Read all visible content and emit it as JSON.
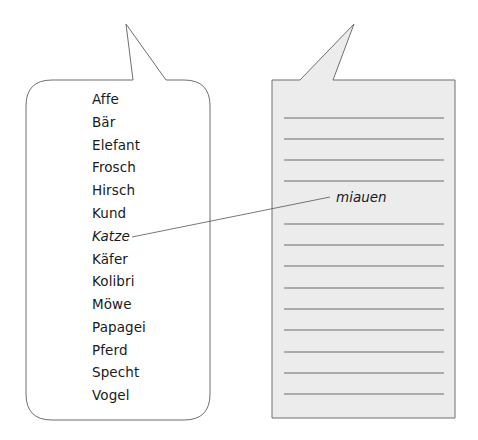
{
  "exercise": {
    "left_bubble": {
      "words": [
        {
          "text": "Affe",
          "italic": false
        },
        {
          "text": "Bär",
          "italic": false
        },
        {
          "text": "Elefant",
          "italic": false
        },
        {
          "text": "Frosch",
          "italic": false
        },
        {
          "text": "Hirsch",
          "italic": false
        },
        {
          "text": "Kund",
          "italic": false
        },
        {
          "text": "Katze",
          "italic": true
        },
        {
          "text": "Käfer",
          "italic": false
        },
        {
          "text": "Kolibri",
          "italic": false
        },
        {
          "text": "Möwe",
          "italic": false
        },
        {
          "text": "Papagei",
          "italic": false
        },
        {
          "text": "Pferd",
          "italic": false
        },
        {
          "text": "Specht",
          "italic": false
        },
        {
          "text": "Vogel",
          "italic": false
        }
      ]
    },
    "right_bubble": {
      "answer": "miauen",
      "blank_line_count": 13
    },
    "connector": {
      "from": "Katze",
      "to": "miauen"
    }
  },
  "colors": {
    "left_bubble_fill": "#ffffff",
    "right_bubble_fill": "#ececec",
    "outline": "#6f6f6f",
    "ruled_line": "#6a6a6a",
    "text": "#1a1a1a"
  }
}
